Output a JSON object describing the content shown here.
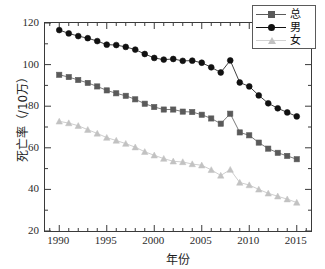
{
  "chart_data": {
    "type": "line",
    "title": "",
    "xlabel": "年份",
    "ylabel": "死亡率（/10万）",
    "xlim": [
      1988.5,
      2016.5
    ],
    "ylim": [
      20,
      120
    ],
    "ytick_values": [
      20,
      40,
      60,
      80,
      100,
      120
    ],
    "xtick_values": [
      1990,
      1995,
      2000,
      2005,
      2010,
      2015
    ],
    "grid": false,
    "legend_position": "top-right",
    "x": [
      1990,
      1991,
      1992,
      1993,
      1994,
      1995,
      1996,
      1997,
      1998,
      1999,
      2000,
      2001,
      2002,
      2003,
      2004,
      2005,
      2006,
      2007,
      2008,
      2009,
      2010,
      2011,
      2012,
      2013,
      2014,
      2015
    ],
    "series": [
      {
        "name": "总",
        "marker": "square",
        "color": "#5a5a5a",
        "values": [
          95.1,
          94.0,
          92.6,
          91.2,
          89.5,
          87.6,
          86.2,
          85.0,
          83.3,
          81.2,
          79.6,
          78.4,
          78.4,
          77.4,
          77.2,
          75.9,
          74.1,
          71.6,
          76.4,
          67.4,
          66.0,
          62.5,
          59.6,
          57.6,
          56.1,
          54.5
        ]
      },
      {
        "name": "男",
        "marker": "circle",
        "color": "#111111",
        "values": [
          116.6,
          115.0,
          113.7,
          112.7,
          111.3,
          109.6,
          109.4,
          108.5,
          107.2,
          105.1,
          103.2,
          102.4,
          102.7,
          101.8,
          101.9,
          100.9,
          98.7,
          96.2,
          102.0,
          91.4,
          89.5,
          85.2,
          81.4,
          79.0,
          77.0,
          75.1
        ]
      },
      {
        "name": "女",
        "marker": "triangle",
        "color": "#c2c2c2",
        "values": [
          72.7,
          71.9,
          70.6,
          68.7,
          66.9,
          64.9,
          63.5,
          62.0,
          60.3,
          58.1,
          56.4,
          54.8,
          53.5,
          53.2,
          52.2,
          51.6,
          49.4,
          46.7,
          49.5,
          43.3,
          42.1,
          40.0,
          38.1,
          36.7,
          35.3,
          33.7
        ]
      }
    ]
  },
  "legend": {
    "entries": [
      {
        "label": "总"
      },
      {
        "label": "男"
      },
      {
        "label": "女"
      }
    ]
  }
}
